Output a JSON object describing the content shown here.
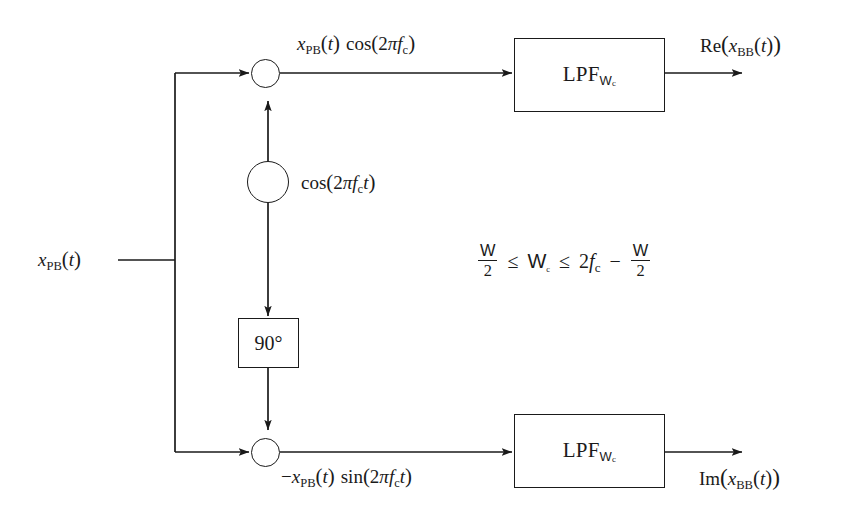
{
  "figure": {
    "background_color": "#ffffff",
    "line_color": "#1a1a1a",
    "width": 858,
    "height": 515
  },
  "labels": {
    "input_signal": "x_PB(t)",
    "input_signal_parts": {
      "base": "x",
      "sub": "PB",
      "arg": "(t)"
    },
    "top_branch_signal": "x_PB(t) cos(2πf_c)",
    "bottom_branch_signal": "−x_PB(t) sin(2πf_c t)",
    "oscillator_signal": "cos(2πf_c t)",
    "output_top": "Re(x_BB(t))",
    "output_bottom": "Im(x_BB(t))"
  },
  "blocks": {
    "lpf_top": {
      "name": "LPF",
      "subscript": "W",
      "subsubscript": "c",
      "full": "LPF_Wc"
    },
    "lpf_bottom": {
      "name": "LPF",
      "subscript": "W",
      "subsubscript": "c",
      "full": "LPF_Wc"
    },
    "phase_shifter": {
      "label": "90°"
    },
    "mixer_top": {
      "symbol": "⊗",
      "name": "multiplier"
    },
    "mixer_bottom": {
      "symbol": "⊗",
      "name": "multiplier"
    },
    "oscillator": {
      "symbol": "sine-wave",
      "name": "local oscillator"
    }
  },
  "constraint": {
    "text": "W/2 ≤ W_c ≤ 2f_c − W/2",
    "left_numerator": "W",
    "left_denominator": "2",
    "relation_1": "≤",
    "middle_base": "W",
    "middle_sub": "c",
    "relation_2": "≤",
    "right_coefficient": "2",
    "right_base": "f",
    "right_sub": "c",
    "minus": "−",
    "right_numerator": "W",
    "right_denominator": "2"
  }
}
